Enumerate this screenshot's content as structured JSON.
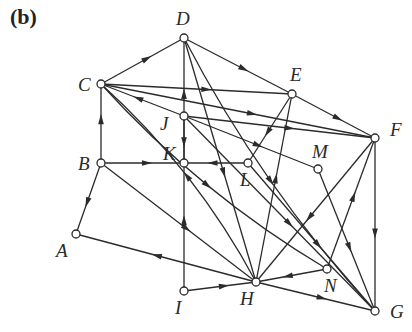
{
  "panel_label": "(b)",
  "colors": {
    "stroke": "#2b2b2b",
    "background": "#ffffff"
  },
  "nodes": [
    {
      "id": "A",
      "x": 76,
      "y": 234,
      "lx": 56,
      "ly": 257
    },
    {
      "id": "B",
      "x": 101,
      "y": 163,
      "lx": 78,
      "ly": 170
    },
    {
      "id": "C",
      "x": 101,
      "y": 84,
      "lx": 78,
      "ly": 91
    },
    {
      "id": "D",
      "x": 184,
      "y": 38,
      "lx": 176,
      "ly": 25
    },
    {
      "id": "E",
      "x": 292,
      "y": 94,
      "lx": 290,
      "ly": 81
    },
    {
      "id": "F",
      "x": 375,
      "y": 138,
      "lx": 390,
      "ly": 136
    },
    {
      "id": "G",
      "x": 375,
      "y": 311,
      "lx": 390,
      "ly": 318
    },
    {
      "id": "H",
      "x": 256,
      "y": 282,
      "lx": 240,
      "ly": 305
    },
    {
      "id": "I",
      "x": 184,
      "y": 291,
      "lx": 175,
      "ly": 314
    },
    {
      "id": "J",
      "x": 184,
      "y": 116,
      "lx": 160,
      "ly": 130
    },
    {
      "id": "K",
      "x": 184,
      "y": 163,
      "lx": 163,
      "ly": 160
    },
    {
      "id": "L",
      "x": 248,
      "y": 163,
      "lx": 240,
      "ly": 186
    },
    {
      "id": "M",
      "x": 318,
      "y": 169,
      "lx": 312,
      "ly": 158
    },
    {
      "id": "N",
      "x": 327,
      "y": 269,
      "lx": 324,
      "ly": 292
    }
  ],
  "edges": [
    {
      "from": "C",
      "to": "D"
    },
    {
      "from": "D",
      "to": "E"
    },
    {
      "from": "E",
      "to": "F"
    },
    {
      "from": "C",
      "to": "E"
    },
    {
      "from": "C",
      "to": "F"
    },
    {
      "from": "J",
      "to": "C"
    },
    {
      "from": "J",
      "to": "F"
    },
    {
      "from": "J",
      "to": "M"
    },
    {
      "from": "J",
      "to": "K"
    },
    {
      "from": "K",
      "to": "D"
    },
    {
      "from": "B",
      "to": "C"
    },
    {
      "from": "B",
      "to": "K"
    },
    {
      "from": "L",
      "to": "K"
    },
    {
      "from": "E",
      "to": "L"
    },
    {
      "from": "B",
      "to": "A"
    },
    {
      "from": "B",
      "to": "H"
    },
    {
      "from": "H",
      "to": "A"
    },
    {
      "from": "H",
      "to": "C",
      "curve": true
    },
    {
      "from": "C",
      "to": "N",
      "curve": true
    },
    {
      "from": "D",
      "to": "H"
    },
    {
      "from": "H",
      "to": "E"
    },
    {
      "from": "J",
      "to": "G"
    },
    {
      "from": "L",
      "to": "G"
    },
    {
      "from": "M",
      "to": "G"
    },
    {
      "from": "F",
      "to": "H"
    },
    {
      "from": "N",
      "to": "F"
    },
    {
      "from": "F",
      "to": "G"
    },
    {
      "from": "N",
      "to": "H"
    },
    {
      "from": "H",
      "to": "G"
    },
    {
      "from": "I",
      "to": "H"
    },
    {
      "from": "I",
      "to": "K"
    },
    {
      "from": "D",
      "to": "G",
      "curve": true
    }
  ]
}
